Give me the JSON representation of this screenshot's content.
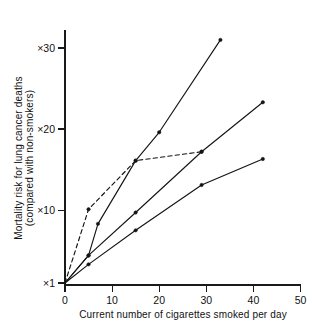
{
  "chart_data": {
    "type": "line",
    "title": "",
    "xlabel": "Current number of cigarettes smoked per day",
    "ylabel": "Mortality risk for lung cancer deaths (compared with non-smokers)",
    "ylabel_line1": "Mortality risk for lung cancer deaths",
    "ylabel_line2": "(compared with non-smokers)",
    "xlim": [
      0,
      50
    ],
    "ylim": [
      1,
      33
    ],
    "grid": false,
    "legend": "none",
    "xticks": [
      0,
      10,
      20,
      30,
      40,
      50
    ],
    "xtick_labels": [
      "0",
      "10",
      "20",
      "30",
      "40",
      "50"
    ],
    "yticks": [
      1,
      10,
      20,
      30
    ],
    "ytick_labels": [
      "×1",
      "×10",
      "×20",
      "×30"
    ],
    "series": [
      {
        "name": "series-dashed",
        "style": "dashed",
        "markers": true,
        "x": [
          0,
          5,
          15,
          29
        ],
        "y": [
          1,
          10.1,
          16.1,
          17.2
        ]
      },
      {
        "name": "series-steep",
        "style": "solid",
        "markers": true,
        "x": [
          0,
          5,
          7,
          15,
          20,
          33
        ],
        "y": [
          1,
          4.4,
          8.3,
          16.1,
          19.6,
          31.0
        ]
      },
      {
        "name": "series-middle",
        "style": "solid",
        "markers": true,
        "x": [
          0,
          5,
          15,
          29,
          42
        ],
        "y": [
          1,
          4.4,
          9.7,
          17.2,
          23.3
        ]
      },
      {
        "name": "series-shallow",
        "style": "solid",
        "markers": true,
        "x": [
          0,
          5,
          15,
          29,
          42
        ],
        "y": [
          1,
          3.3,
          7.5,
          13.1,
          16.3
        ]
      }
    ]
  }
}
